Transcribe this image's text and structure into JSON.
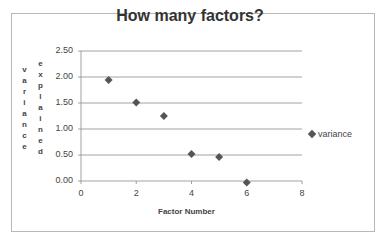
{
  "chart_data": {
    "type": "scatter",
    "title": "How many factors?",
    "xlabel": "Factor Number",
    "ylabel": "variance explained",
    "ylabel_line1": "variance",
    "ylabel_line2": "explained",
    "x_ticks": [
      "0",
      "2",
      "4",
      "6",
      "8"
    ],
    "y_ticks": [
      "2.50",
      "2.00",
      "1.50",
      "1.00",
      "0.50",
      "0.00"
    ],
    "xlim": [
      0,
      8
    ],
    "ylim": [
      0,
      2.5
    ],
    "grid": "horizontal",
    "legend_position": "right",
    "series": [
      {
        "name": "variance",
        "marker": "diamond",
        "color": "#555555",
        "x": [
          1,
          2,
          3,
          4,
          5,
          6
        ],
        "y": [
          1.94,
          1.51,
          1.25,
          0.52,
          0.46,
          -0.03
        ]
      }
    ]
  },
  "legend": {
    "label": "variance"
  }
}
